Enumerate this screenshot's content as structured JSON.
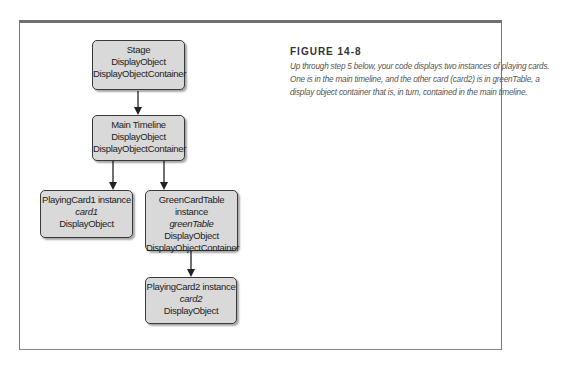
{
  "page": {
    "top_caption": "Up through step 5 below, your code displays two instances of playing cards."
  },
  "figure": {
    "label": "FIGURE 14-8",
    "caption_lines": [
      "Up through step 5 below, your code displays two instances of playing cards.",
      "One is in the main timeline, and the other card (card2) is in greenTable, a",
      "display object container that is, in turn, contained in the main timeline."
    ]
  },
  "diagram": {
    "nodes": {
      "stage": {
        "lines": [
          "Stage",
          "DisplayObject",
          "DisplayObjectContainer"
        ]
      },
      "main_timeline": {
        "lines": [
          "Main Timeline",
          "DisplayObject",
          "DisplayObjectContainer"
        ]
      },
      "playing_card1": {
        "title": "PlayingCard1 instance",
        "instance": "card1",
        "type1": "DisplayObject"
      },
      "green_card_table": {
        "title": "GreenCardTable instance",
        "instance": "greenTable",
        "type1": "DisplayObject",
        "type2": "DisplayObjectContainer"
      },
      "playing_card2": {
        "title": "PlayingCard2 instance",
        "instance": "card2",
        "type1": "DisplayObject"
      }
    },
    "edges": [
      [
        "stage",
        "main_timeline"
      ],
      [
        "main_timeline",
        "playing_card1"
      ],
      [
        "main_timeline",
        "green_card_table"
      ],
      [
        "green_card_table",
        "playing_card2"
      ]
    ],
    "colors": {
      "node_fill": "#d9d9d9",
      "node_border": "#3a3a3a",
      "arrow": "#222222"
    }
  }
}
